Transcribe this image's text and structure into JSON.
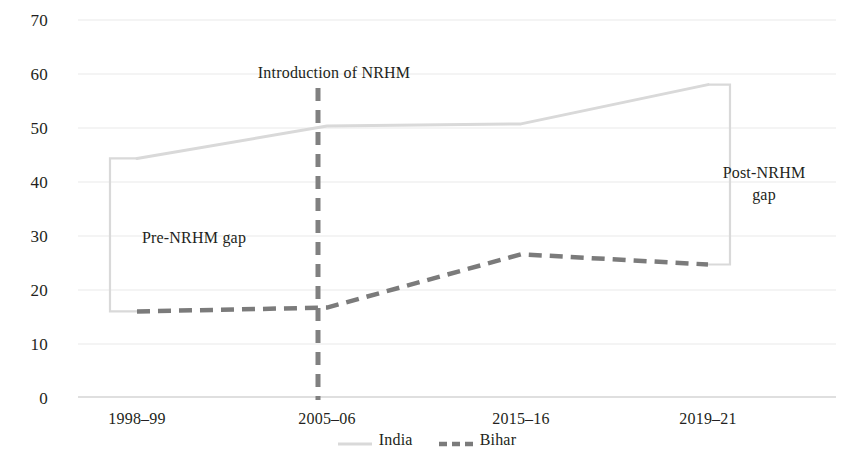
{
  "chart_data": {
    "type": "line",
    "title": "",
    "subtitle": "",
    "xlabel": "",
    "ylabel": "",
    "categories": [
      "1998–99",
      "2005–06",
      "2015–16",
      "2019–21"
    ],
    "series": [
      {
        "name": "India",
        "values": [
          44.3,
          50.3,
          50.7,
          58.0
        ],
        "color": "#d9d9d9",
        "style": "solid"
      },
      {
        "name": "Bihar",
        "values": [
          15.9,
          16.6,
          26.5,
          24.6
        ],
        "color": "#7b7b7b",
        "style": "dashed"
      }
    ],
    "ylim": [
      0,
      70
    ],
    "yticks": [
      0,
      10,
      20,
      30,
      40,
      50,
      60,
      70
    ],
    "ytick_labels": [
      "0",
      "10",
      "20",
      "30",
      "40",
      "50",
      "60",
      "70"
    ],
    "grid": true,
    "legend_position": "bottom",
    "legend_entries": [
      "India",
      "Bihar"
    ],
    "annotations": [
      {
        "text": "Introduction of NRHM",
        "at_category": "2005–06"
      },
      {
        "text": "Pre-NRHM gap",
        "at_category": "1998–99"
      },
      {
        "text": "Post-NRHM\ngap",
        "at_category": "2019–21"
      }
    ],
    "event_marker": {
      "label": "Introduction of NRHM",
      "at_category": "2005–06",
      "style": "dashed-vertical",
      "color": "#808080"
    },
    "gap_brackets": [
      {
        "name": "Pre-NRHM gap",
        "at_category": "1998–99",
        "from": 15.9,
        "to": 44.3,
        "color": "#d9d9d9"
      },
      {
        "name": "Post-NRHM gap",
        "at_category": "2019–21",
        "from": 24.6,
        "to": 58.0,
        "color": "#d9d9d9"
      }
    ]
  },
  "axis": {
    "ytick_labels": [
      "70",
      "60",
      "50",
      "40",
      "30",
      "20",
      "10",
      "0"
    ],
    "xtick_labels": [
      "1998–99",
      "2005–06",
      "2015–16",
      "2019–21"
    ]
  },
  "annotations": {
    "nrhm_event": "Introduction of NRHM",
    "pre_gap": "Pre-NRHM gap",
    "post_gap_line1": "Post-NRHM",
    "post_gap_line2": "gap"
  },
  "legend": {
    "india": "India",
    "bihar": "Bihar"
  },
  "colors": {
    "india_line": "#d9d9d9",
    "bihar_line": "#7b7b7b",
    "grid": "#e8e8e8",
    "event_line": "#808080",
    "text": "#231f20"
  }
}
